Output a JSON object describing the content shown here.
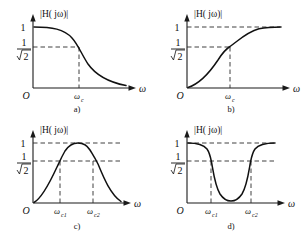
{
  "figure": {
    "background_color": "#ffffff",
    "curve_color": "#111111",
    "axis_color": "#1a1a1a",
    "dash_color": "#2a2a2a"
  },
  "common": {
    "magnitude_label": "|H( jω)|",
    "omega_label": "ω",
    "origin_label": "O",
    "level_one": "1",
    "frac_numerator": "1",
    "frac_denominator": "2",
    "frac_denominator_full": "√2",
    "level_cutoff": "1/√2"
  },
  "panels": [
    {
      "id": "a",
      "caption": "a)",
      "filter_type": "low-pass",
      "y_ticks": [
        "1",
        "1/√2"
      ],
      "x_ticks": [
        "ωc"
      ],
      "x_tick_base": "ω",
      "x_tick_sub": "c",
      "dashed_lines": [
        "horizontal at 1/√2",
        "vertical at ωc"
      ],
      "description": "Magnitude starts at 1 at dc, stays flat, rolls off through 1/√2 at ωc and decays toward 0"
    },
    {
      "id": "b",
      "caption": "b)",
      "filter_type": "high-pass",
      "y_ticks": [
        "1",
        "1/√2"
      ],
      "x_ticks": [
        "ωc"
      ],
      "x_tick_base": "ω",
      "x_tick_sub": "c",
      "dashed_lines": [
        "horizontal at 1",
        "horizontal at 1/√2",
        "vertical at ωc"
      ],
      "description": "Magnitude starts at 0 at origin, rises through 1/√2 at ωc and asymptotically approaches 1"
    },
    {
      "id": "c",
      "caption": "c)",
      "filter_type": "band-pass",
      "y_ticks": [
        "1",
        "1/√2"
      ],
      "x_ticks": [
        "ωc1",
        "ωc2"
      ],
      "x_tick_base": "ω",
      "x_tick_subs": [
        "c1",
        "c2"
      ],
      "dashed_lines": [
        "horizontal at 1",
        "horizontal at 1/√2",
        "vertical at ωc1",
        "vertical at ωc2"
      ],
      "description": "Magnitude rises from 0, peaks at 1 between ωc1 and ωc2, crossing 1/√2 at both cutoffs, then decays"
    },
    {
      "id": "d",
      "caption": "d)",
      "filter_type": "band-stop",
      "y_ticks": [
        "1",
        "1/√2"
      ],
      "x_ticks": [
        "ωc1",
        "ωc2"
      ],
      "x_tick_base": "ω",
      "x_tick_subs": [
        "c1",
        "c2"
      ],
      "dashed_lines": [
        "horizontal at 1",
        "horizontal at 1/√2",
        "vertical at ωc1",
        "vertical at ωc2"
      ],
      "description": "Magnitude is 1 at low frequency, notches down to near 0 between ωc1 and ωc2 crossing 1/√2 at both, returns to 1"
    }
  ]
}
